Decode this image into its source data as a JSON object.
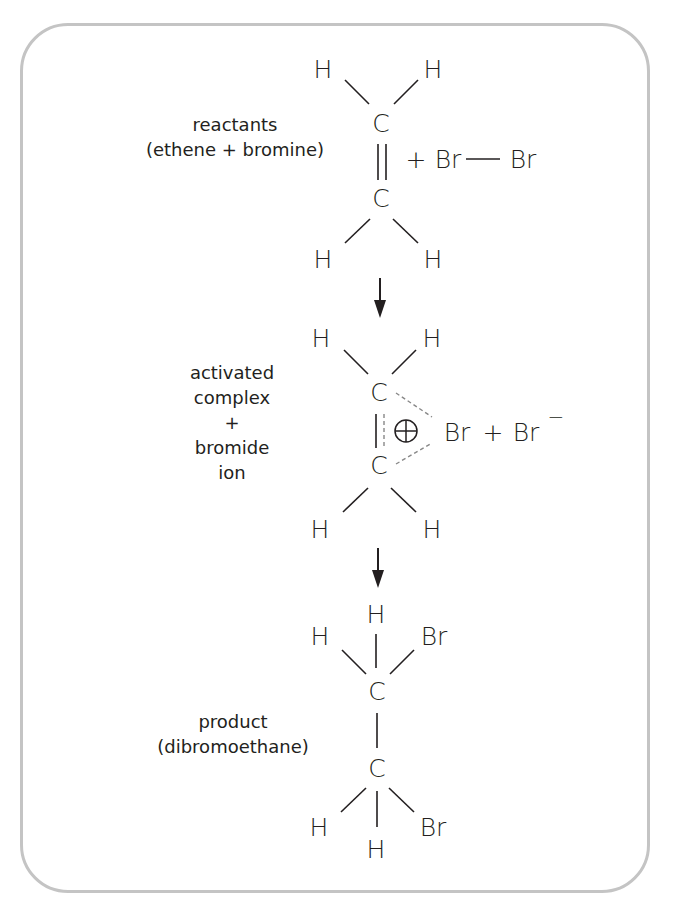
{
  "diagram": {
    "type": "reaction-mechanism",
    "stages": [
      {
        "id": "reactants",
        "label_lines": [
          "reactants",
          "(ethene + bromine)"
        ],
        "atoms": {
          "top_left": "H",
          "top_right": "H",
          "c1": "C",
          "c2": "C",
          "bottom_left": "H",
          "bottom_right": "H"
        },
        "extra": {
          "plus": "+",
          "br1": "Br",
          "br2": "Br"
        }
      },
      {
        "id": "activated-complex",
        "label_lines": [
          "activated",
          "complex",
          "+",
          "bromide",
          "ion"
        ],
        "atoms": {
          "top_left": "H",
          "top_right": "H",
          "c1": "C",
          "c2": "C",
          "bottom_left": "H",
          "bottom_right": "H"
        },
        "extra": {
          "charge": "⊕",
          "br": "Br",
          "plus": "+",
          "br_ion": "Br",
          "minus": "−"
        }
      },
      {
        "id": "product",
        "label_lines": [
          "product",
          "(dibromoethane)"
        ],
        "atoms": {
          "top_left": "H",
          "top_mid": "H",
          "top_right": "Br",
          "c1": "C",
          "c2": "C",
          "bottom_left": "H",
          "bottom_mid": "H",
          "bottom_right": "Br"
        }
      }
    ],
    "arrows": [
      "reactants-to-complex",
      "complex-to-product"
    ],
    "colors": {
      "ink": "#231f20",
      "frame": "#c4c4c4",
      "dashed_bond": "#888888"
    }
  }
}
